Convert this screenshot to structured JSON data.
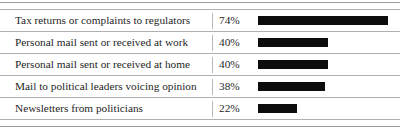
{
  "chart_data": {
    "type": "bar",
    "title": "",
    "subtitle": "",
    "xlabel": "",
    "ylabel": "",
    "orientation": "horizontal",
    "grid": false,
    "legend": false,
    "axis_visible": false,
    "value_suffix": "%",
    "xlim": [
      0,
      100
    ],
    "bar_color": "#0d0d0d",
    "bar_max_percent": 74,
    "categories": [
      "Tax returns or complaints to regulators",
      "Personal mail sent or received at work",
      "Personal mail sent or received at home",
      "Mail to political leaders voicing opinion",
      "Newsletters from politicians"
    ],
    "values": [
      74,
      40,
      40,
      38,
      22
    ],
    "value_labels": [
      "74%",
      "40%",
      "40%",
      "38%",
      "22%"
    ]
  },
  "table": {
    "rows": [
      {
        "label": "Tax returns or complaints to regulators",
        "value_label": "74%",
        "value": 74
      },
      {
        "label": "Personal mail sent or received at work",
        "value_label": "40%",
        "value": 40
      },
      {
        "label": "Personal mail sent or received at home",
        "value_label": "40%",
        "value": 40
      },
      {
        "label": "Mail to political leaders voicing opinion",
        "value_label": "38%",
        "value": 38
      },
      {
        "label": "Newsletters from politicians",
        "value_label": "22%",
        "value": 22
      }
    ]
  },
  "style": {
    "rule_color": "#9a9a9a",
    "separator_color": "#b0b0b0",
    "divider_color": "#b8b8b8",
    "text_color": "#1f1f1f",
    "bar_color": "#0d0d0d",
    "background": "#ffffff"
  }
}
